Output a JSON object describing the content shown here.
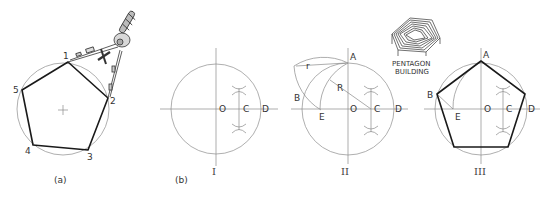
{
  "figure": {
    "colors": {
      "construction_line": "#8a8a8a",
      "object_line": "#1a1a1a",
      "text": "#333333",
      "background": "#ffffff"
    }
  },
  "panel_a": {
    "caption": "(a)",
    "vertex_labels": [
      "1",
      "2",
      "3",
      "4",
      "5"
    ],
    "tool": "compass-dividers"
  },
  "panel_b": {
    "caption": "(b)",
    "steps": [
      {
        "numeral": "I",
        "points": {
          "O": "O",
          "C": "C",
          "D": "D"
        }
      },
      {
        "numeral": "II",
        "points": {
          "A": "A",
          "B": "B",
          "O": "O",
          "C": "C",
          "D": "D",
          "E": "E"
        },
        "radii": {
          "R": "R",
          "r": "r"
        }
      },
      {
        "numeral": "III",
        "points": {
          "A": "A",
          "B": "B",
          "O": "O",
          "C": "C",
          "D": "D",
          "E": "E"
        }
      }
    ]
  },
  "inset": {
    "line1": "PENTAGON",
    "line2": "BUILDING"
  }
}
